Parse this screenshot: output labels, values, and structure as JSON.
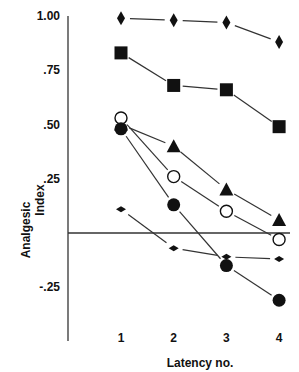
{
  "chart_data": {
    "type": "line",
    "title": "",
    "xlabel": "Latency no.",
    "ylabel": "Analgesic Index",
    "ylabel_lines": [
      "Analgesic",
      "Index"
    ],
    "x": [
      1,
      2,
      3,
      4
    ],
    "x_tick_labels": [
      "1",
      "2",
      "3",
      "4"
    ],
    "y_ticks": [
      1.0,
      0.75,
      0.5,
      0.25,
      -0.25
    ],
    "y_tick_labels": [
      "1.00",
      ".75",
      ".50",
      ".25",
      "-.25"
    ],
    "ylim": [
      -0.45,
      1.0
    ],
    "zero_line": true,
    "grid": false,
    "legend": null,
    "series": [
      {
        "name": "diamond-large",
        "marker": "diamond",
        "filled": true,
        "values": [
          0.99,
          0.98,
          0.97,
          0.88
        ]
      },
      {
        "name": "square",
        "marker": "square",
        "filled": true,
        "values": [
          0.83,
          0.68,
          0.66,
          0.49
        ]
      },
      {
        "name": "triangle",
        "marker": "triangle",
        "filled": true,
        "values": [
          0.5,
          0.4,
          0.2,
          0.06
        ]
      },
      {
        "name": "open-circle",
        "marker": "circle",
        "filled": false,
        "values": [
          0.53,
          0.26,
          0.1,
          -0.03
        ]
      },
      {
        "name": "filled-circle",
        "marker": "circle",
        "filled": true,
        "values": [
          0.48,
          0.13,
          -0.15,
          -0.31
        ]
      },
      {
        "name": "diamond-small",
        "marker": "diamond-small",
        "filled": true,
        "values": [
          0.11,
          -0.07,
          -0.11,
          -0.12
        ]
      }
    ]
  }
}
